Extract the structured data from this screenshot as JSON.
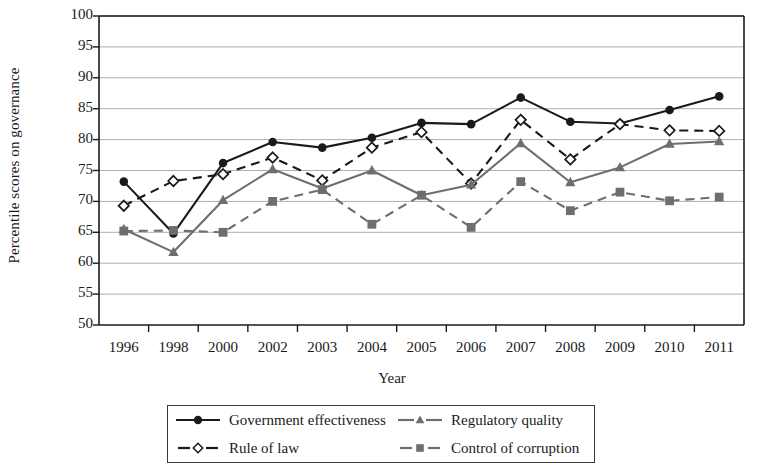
{
  "chart_data": {
    "type": "line",
    "title": "",
    "xlabel": "Year",
    "ylabel": "Percentile scores on governance",
    "categories": [
      "1996",
      "1998",
      "2000",
      "2002",
      "2003",
      "2004",
      "2005",
      "2006",
      "2007",
      "2008",
      "2009",
      "2010",
      "2011"
    ],
    "ylim": [
      50,
      100
    ],
    "yticks": [
      50,
      55,
      60,
      65,
      70,
      75,
      80,
      85,
      90,
      95,
      100
    ],
    "grid": true,
    "legend_position": "below",
    "series": [
      {
        "name": "Government effectiveness",
        "marker": "filled-circle",
        "line_style": "solid",
        "color": "#1a1a1a",
        "values": [
          73.2,
          64.8,
          76.2,
          79.6,
          78.7,
          80.3,
          82.7,
          82.5,
          86.8,
          82.9,
          82.6,
          84.8,
          87.0
        ]
      },
      {
        "name": "Rule of law",
        "marker": "open-diamond",
        "line_style": "dashed",
        "color": "#1a1a1a",
        "values": [
          69.3,
          73.3,
          74.4,
          77.1,
          73.4,
          78.7,
          81.2,
          72.9,
          83.2,
          76.8,
          82.5,
          81.5,
          81.4
        ]
      },
      {
        "name": "Regulatory quality",
        "marker": "filled-triangle",
        "line_style": "solid",
        "color": "#6e6e6e",
        "values": [
          65.5,
          61.8,
          70.2,
          75.2,
          72.1,
          75.0,
          71.0,
          72.7,
          79.4,
          73.1,
          75.5,
          79.3,
          79.7
        ]
      },
      {
        "name": "Control of corruption",
        "marker": "filled-square",
        "line_style": "dashed",
        "color": "#6e6e6e",
        "values": [
          65.2,
          65.3,
          65.0,
          70.0,
          71.9,
          66.3,
          71.0,
          65.8,
          73.2,
          68.5,
          71.5,
          70.1,
          70.7
        ]
      }
    ]
  },
  "axes": {
    "x_axis_title": "Year",
    "y_axis_title": "Percentile scores on governance"
  },
  "legend": {
    "entries": [
      {
        "label": "Government effectiveness"
      },
      {
        "label": "Regulatory quality"
      },
      {
        "label": "Rule of law"
      },
      {
        "label": "Control of corruption"
      }
    ]
  }
}
